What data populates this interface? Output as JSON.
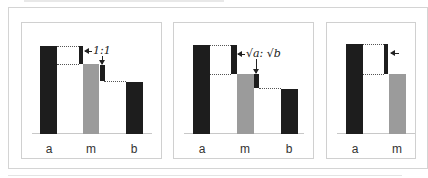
{
  "figure": {
    "panels": [
      {
        "id": "panel-1",
        "labels": {
          "a": "a",
          "m": "m",
          "b": "b"
        },
        "ratio_text": "1:1"
      },
      {
        "id": "panel-2",
        "labels": {
          "a": "a",
          "m": "m",
          "b": "b"
        },
        "ratio_text": "√a: √b"
      },
      {
        "id": "panel-3",
        "labels": {
          "a": "a",
          "m": "m",
          "b": ""
        },
        "ratio_text": ""
      }
    ],
    "colors": {
      "dark_bar": "#1d1d1d",
      "mean_bar": "#9b9b9b",
      "frame": "#d0d0d0"
    }
  }
}
